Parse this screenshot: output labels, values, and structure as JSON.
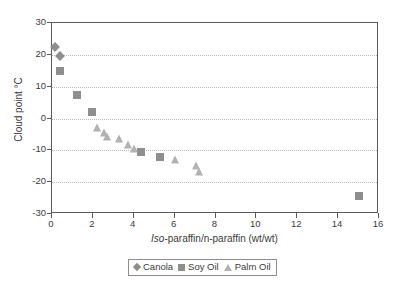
{
  "chart_data": {
    "type": "scatter",
    "title": "",
    "xlabel": "Iso-paraffin/n-paraffin (wt/wt)",
    "xlabel_italic_prefix": "Iso",
    "xlabel_rest": "-paraffin/n-paraffin (wt/wt)",
    "ylabel": "Cloud point °C",
    "xlim": [
      0,
      16
    ],
    "ylim": [
      -30,
      30
    ],
    "xticks": [
      0,
      2,
      4,
      6,
      8,
      10,
      12,
      14,
      16
    ],
    "xtick_labels": [
      "0",
      "2",
      "4",
      "6",
      "8",
      "10",
      "12",
      "14",
      "16"
    ],
    "yticks": [
      -30,
      -20,
      -10,
      0,
      10,
      20,
      30
    ],
    "ytick_labels": [
      "-30",
      "-20",
      "-10",
      "0",
      "10",
      "20",
      "30"
    ],
    "grid": "horizontal-dotted",
    "legend_position": "below-axes-center",
    "series": [
      {
        "name": "Canola",
        "marker": "diamond",
        "color": "#8e8e8e",
        "points": [
          {
            "x": 0.15,
            "y": 22.5
          },
          {
            "x": 0.4,
            "y": 19.5
          }
        ]
      },
      {
        "name": "Soy Oil",
        "marker": "square",
        "color": "#8e8e8e",
        "points": [
          {
            "x": 0.4,
            "y": 14.8
          },
          {
            "x": 1.2,
            "y": 7.5
          },
          {
            "x": 1.95,
            "y": 2.0
          },
          {
            "x": 4.35,
            "y": -10.5
          },
          {
            "x": 5.3,
            "y": -12.0
          },
          {
            "x": 15.0,
            "y": -24.5
          }
        ]
      },
      {
        "name": "Palm Oil",
        "marker": "triangle",
        "color": "#b2b2b2",
        "points": [
          {
            "x": 2.2,
            "y": -3.0
          },
          {
            "x": 2.55,
            "y": -4.5
          },
          {
            "x": 2.7,
            "y": -5.8
          },
          {
            "x": 3.3,
            "y": -6.5
          },
          {
            "x": 3.7,
            "y": -8.2
          },
          {
            "x": 4.0,
            "y": -9.5
          },
          {
            "x": 6.0,
            "y": -13.0
          },
          {
            "x": 7.05,
            "y": -15.0
          },
          {
            "x": 7.2,
            "y": -16.8
          }
        ]
      }
    ]
  },
  "legend": {
    "items": [
      {
        "label": "Canola",
        "marker": "diamond"
      },
      {
        "label": "Soy Oil",
        "marker": "square"
      },
      {
        "label": "Palm Oil",
        "marker": "triangle"
      }
    ]
  }
}
